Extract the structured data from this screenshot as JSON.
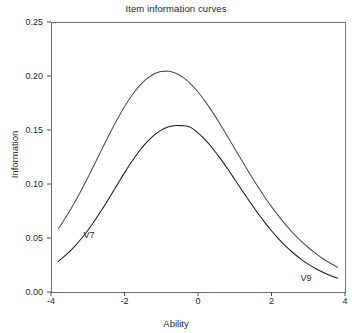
{
  "chart_data": {
    "type": "line",
    "title": "Item information curves",
    "xlabel": "Ability",
    "ylabel": "Information",
    "xlim": [
      -4,
      4
    ],
    "ylim": [
      0.0,
      0.25
    ],
    "xticks": [
      "-4",
      "-2",
      "0",
      "2",
      "4"
    ],
    "xtick_values": [
      -4,
      -2,
      0,
      2,
      4
    ],
    "yticks": [
      "0.00",
      "0.05",
      "0.10",
      "0.15",
      "0.20",
      "0.25"
    ],
    "ytick_values": [
      0.0,
      0.05,
      0.1,
      0.15,
      0.2,
      0.25
    ],
    "grid": false,
    "legend": "inline-annotations",
    "annotations": [
      {
        "text": "V7",
        "x": -2.95,
        "y": 0.052
      },
      {
        "text": "V9",
        "x": 2.95,
        "y": 0.012
      }
    ],
    "series": [
      {
        "name": "V9",
        "color": "#4d4d4d",
        "peak_x": -1.1,
        "peak_y": 0.25,
        "x": [
          -3.8,
          -3.6,
          -3.4,
          -3.2,
          -3.0,
          -2.8,
          -2.6,
          -2.4,
          -2.2,
          -2.0,
          -1.8,
          -1.6,
          -1.4,
          -1.2,
          -1.1,
          -1.0,
          -0.8,
          -0.6,
          -0.4,
          -0.2,
          0.0,
          0.2,
          0.4,
          0.6,
          0.8,
          1.0,
          1.2,
          1.4,
          1.6,
          1.8,
          2.0,
          2.2,
          2.4,
          2.6,
          2.8,
          3.0,
          3.2,
          3.4,
          3.6,
          3.8
        ],
        "y": [
          0.0586,
          0.0689,
          0.0803,
          0.0926,
          0.1058,
          0.1194,
          0.1332,
          0.1468,
          0.1597,
          0.1716,
          0.182,
          0.1906,
          0.1973,
          0.2018,
          0.2032,
          0.2042,
          0.2044,
          0.2025,
          0.1985,
          0.1927,
          0.1852,
          0.1763,
          0.1663,
          0.1555,
          0.1442,
          0.1327,
          0.1212,
          0.1099,
          0.099,
          0.0887,
          0.079,
          0.07,
          0.0617,
          0.0541,
          0.0473,
          0.0412,
          0.0357,
          0.0308,
          0.0266,
          0.0228
        ]
      },
      {
        "name": "V7",
        "color": "#1a1a1a",
        "peak_x": -0.3,
        "peak_y": 0.25,
        "x": [
          -3.8,
          -3.6,
          -3.4,
          -3.2,
          -3.0,
          -2.8,
          -2.6,
          -2.4,
          -2.2,
          -2.0,
          -1.8,
          -1.6,
          -1.4,
          -1.2,
          -1.0,
          -0.8,
          -0.6,
          -0.4,
          -0.3,
          -0.2,
          0.0,
          0.2,
          0.4,
          0.6,
          0.8,
          1.0,
          1.2,
          1.4,
          1.6,
          1.8,
          2.0,
          2.2,
          2.4,
          2.6,
          2.8,
          3.0,
          3.2,
          3.4,
          3.6,
          3.8
        ],
        "y": [
          0.0284,
          0.0341,
          0.0407,
          0.0484,
          0.057,
          0.0666,
          0.077,
          0.088,
          0.0992,
          0.1103,
          0.1208,
          0.1303,
          0.1385,
          0.1451,
          0.1499,
          0.1529,
          0.1542,
          0.154,
          0.1536,
          0.1524,
          0.1474,
          0.1408,
          0.1329,
          0.124,
          0.1143,
          0.1042,
          0.094,
          0.084,
          0.0743,
          0.0652,
          0.0567,
          0.049,
          0.042,
          0.0359,
          0.0305,
          0.0258,
          0.0217,
          0.0182,
          0.0153,
          0.0128
        ]
      }
    ]
  },
  "plot": {
    "box": {
      "left": 51,
      "top": 22,
      "right": 345,
      "bottom": 292
    }
  }
}
